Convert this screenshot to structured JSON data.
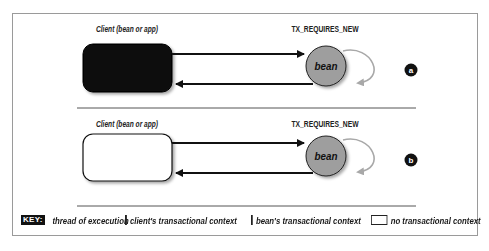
{
  "panels": [
    {
      "id": "a",
      "client_label": "Client (bean or app)",
      "client_context": "client",
      "client_fill": "#0d0d0d",
      "attribute_label": "TX_REQUIRES_NEW",
      "bean_label": "bean",
      "bean_fill": "#9e9e9e",
      "badge": "a"
    },
    {
      "id": "b",
      "client_label": "Client (bean or app)",
      "client_context": "none",
      "client_fill": "#ffffff",
      "attribute_label": "TX_REQUIRES_NEW",
      "bean_label": "bean",
      "bean_fill": "#9e9e9e",
      "badge": "b"
    }
  ],
  "key": {
    "tag": "KEY:",
    "items": [
      {
        "icon": "arrow-icon",
        "label": "thread of excecution"
      },
      {
        "icon": "black-swatch",
        "color": "#0d0d0d",
        "label": "client's transactional context"
      },
      {
        "icon": "gray-swatch",
        "color": "#9e9e9e",
        "label": "bean's transactional context"
      },
      {
        "icon": "white-swatch",
        "color": "#ffffff",
        "label": "no transactional context"
      }
    ]
  },
  "colors": {
    "arrow": "#111111",
    "loop_arrow": "#a8a8a8",
    "frame_border": "#9a9a9a",
    "divider": "#555555"
  }
}
